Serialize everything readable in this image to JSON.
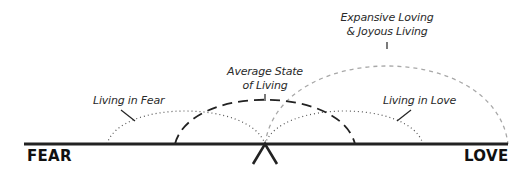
{
  "diagram": {
    "poles": {
      "left": "FEAR",
      "right": "LOVE"
    },
    "labels": {
      "living_in_fear": "Living in Fear",
      "living_in_love": "Living in Love",
      "average_state_line1": "Average State",
      "average_state_line2": "of Living",
      "expansive_line1": "Expansive Loving",
      "expansive_line2": "& Joyous Living"
    },
    "arcs": [
      {
        "name": "living-in-fear",
        "style": "dotted",
        "from_x": 107,
        "to_x": 265,
        "peak_y": 111,
        "color": "#555555"
      },
      {
        "name": "living-in-love",
        "style": "dotted",
        "from_x": 265,
        "to_x": 423,
        "peak_y": 111,
        "color": "#555555"
      },
      {
        "name": "average-state",
        "style": "long-dash",
        "from_x": 175,
        "to_x": 355,
        "peak_y": 101,
        "color": "#222222"
      },
      {
        "name": "expansive-loving",
        "style": "dashed-grey",
        "from_x": 265,
        "to_x": 508,
        "peak_y": 51,
        "color": "#aaaaaa"
      }
    ],
    "colors": {
      "baseline": "#222222",
      "text": "#2a2a2a"
    }
  }
}
